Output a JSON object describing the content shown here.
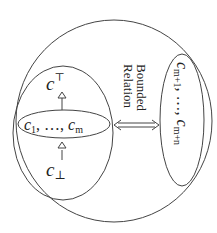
{
  "diagram": {
    "top_concept": {
      "base": "c",
      "sup": "⊤"
    },
    "bottom_concept": {
      "base": "c",
      "sub": "⊥"
    },
    "inner_set": {
      "c1": "c",
      "c1_sub": "1",
      "sep": ", …, ",
      "cm": "c",
      "cm_sub": "m"
    },
    "relation_label": {
      "line1": "Bounded",
      "line2": "Relation"
    },
    "outer_set": {
      "a": "c",
      "a_sub": "m+1",
      "sep": ", …, ",
      "b": "c",
      "b_sub": "m+n"
    },
    "colors": {
      "stroke": "#444444",
      "text": "#222222"
    }
  }
}
